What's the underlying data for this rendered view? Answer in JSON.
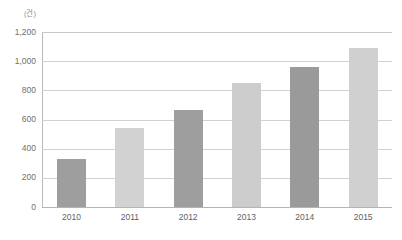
{
  "chart_data": {
    "type": "bar",
    "title": "",
    "subtitle": "",
    "unit_label": "(건)",
    "xlabel": "",
    "ylabel": "",
    "categories": [
      "2010",
      "2011",
      "2012",
      "2013",
      "2014",
      "2015"
    ],
    "values": [
      330,
      545,
      665,
      850,
      960,
      1090
    ],
    "ylim": [
      0,
      1200
    ],
    "y_ticks": [
      0,
      200,
      400,
      600,
      800,
      1000,
      1200
    ],
    "y_tick_labels": [
      "0",
      "200",
      "400",
      "600",
      "800",
      "1,000",
      "1,200"
    ],
    "grid": true,
    "legend": "none",
    "bar_colors": [
      "#9e9e9e",
      "#d2d2d2",
      "#9e9e9e",
      "#cccccc",
      "#9a9a9a",
      "#d0d0d0"
    ],
    "series": [
      {
        "name": "count",
        "values": [
          330,
          545,
          665,
          850,
          960,
          1090
        ]
      }
    ]
  },
  "axis": {
    "gridline_color": "#d2d2d2",
    "baseline_color": "#b4b4b4",
    "y_axis_color": "#b9b9b9",
    "tick_text_color": "#6f6f6f"
  }
}
